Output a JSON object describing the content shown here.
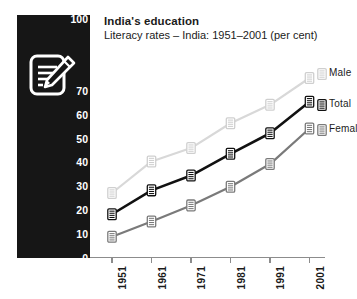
{
  "title": {
    "main": "India's education",
    "sub": "Literacy rates – India: 1951–2001 (per cent)"
  },
  "icons": {
    "panel": "notepad-pencil-icon",
    "marker": "notepad-marker-icon"
  },
  "colors": {
    "panel_background": "#161616",
    "male_line": "#d8d8d8",
    "total_line": "#111111",
    "female_line": "#7a7a7a",
    "axis": "#8c8c8c",
    "text": "#1b1b1b",
    "panel_text": "#ffffff"
  },
  "legend": {
    "position": "right",
    "entries": [
      {
        "label": "Male",
        "color": "#d8d8d8"
      },
      {
        "label": "Total",
        "color": "#111111"
      },
      {
        "label": "Female",
        "color": "#7a7a7a"
      }
    ]
  },
  "footer": {
    "note": ""
  },
  "chart_data": {
    "type": "line",
    "title": "India's education",
    "subtitle": "Literacy rates – India: 1951–2001 (per cent)",
    "xlabel": "",
    "ylabel": "",
    "ylim": [
      0,
      100
    ],
    "yticks": [
      0,
      10,
      20,
      30,
      40,
      50,
      60,
      70,
      80,
      90,
      100
    ],
    "ytick_labels": [
      "0",
      "10",
      "20",
      "30",
      "40",
      "50",
      "60",
      "70",
      "80",
      "90",
      "100"
    ],
    "ytick_labels_visible": [
      "0",
      "10",
      "20",
      "30",
      "40",
      "50",
      "60",
      "70",
      "100"
    ],
    "grid": false,
    "categories": [
      "1951",
      "1961",
      "1971",
      "1981",
      "1991",
      "2001"
    ],
    "series": [
      {
        "name": "Male",
        "color": "#d8d8d8",
        "values": [
          27.2,
          40.4,
          46.0,
          56.4,
          64.1,
          75.3
        ]
      },
      {
        "name": "Total",
        "color": "#111111",
        "values": [
          18.3,
          28.3,
          34.5,
          43.6,
          52.2,
          65.4
        ]
      },
      {
        "name": "Female",
        "color": "#7a7a7a",
        "values": [
          8.9,
          15.3,
          22.0,
          29.8,
          39.3,
          54.2
        ]
      }
    ]
  }
}
